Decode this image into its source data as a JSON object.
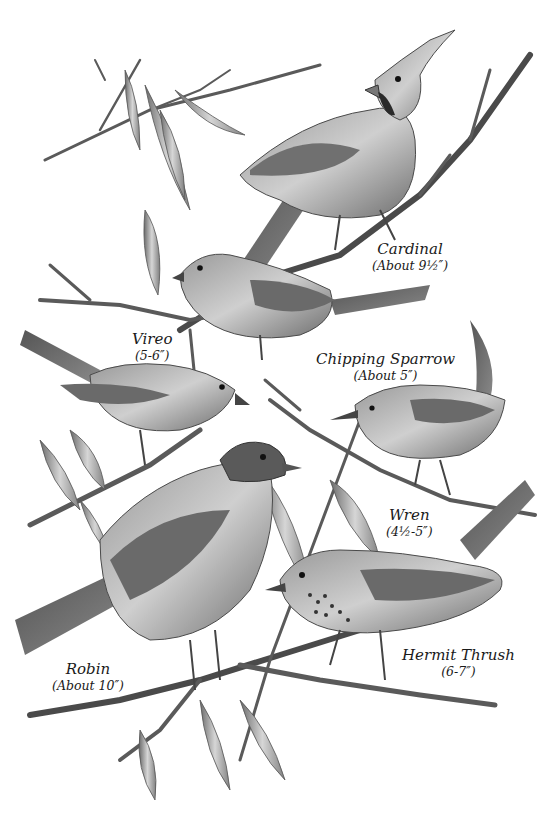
{
  "illustration": {
    "style": "graphite pencil drawing",
    "background": "#ffffff",
    "ink": "#2b2b2b",
    "shade_dark": "#3a3a3a",
    "shade_mid": "#7a7a7a",
    "shade_light": "#bdbdbd"
  },
  "birds": [
    {
      "id": "cardinal",
      "name": "Cardinal",
      "size": "(About 9½″)"
    },
    {
      "id": "chipping-sparrow",
      "name": "Chipping Sparrow",
      "size": "(About 5″)"
    },
    {
      "id": "vireo",
      "name": "Vireo",
      "size": "(5-6″)"
    },
    {
      "id": "wren",
      "name": "Wren",
      "size": "(4½-5″)"
    },
    {
      "id": "hermit-thrush",
      "name": "Hermit Thrush",
      "size": "(6-7″)"
    },
    {
      "id": "robin",
      "name": "Robin",
      "size": "(About 10″)"
    }
  ]
}
